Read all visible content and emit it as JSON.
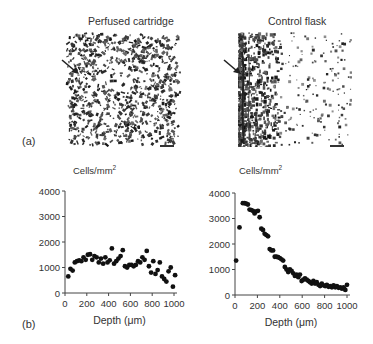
{
  "figure": {
    "panel_a": {
      "label": "(a)",
      "left_title": "Perfused cartridge",
      "right_title": "Control flask",
      "left_image": "microscopy-perfused-cartridge",
      "right_image": "microscopy-control-flask",
      "arrow_icon": "arrow-down-right-icon",
      "scale_bar": "scale-bar"
    },
    "panel_b": {
      "label": "(b)"
    }
  },
  "chart_data": [
    {
      "type": "scatter",
      "title": "Perfused cartridge",
      "ylabel": "Cells/mm²",
      "ylabel_base": "Cells/mm",
      "ylabel_sup": "2",
      "xlabel": "Depth (μm)",
      "xlim": [
        0,
        1000
      ],
      "ylim": [
        0,
        4000
      ],
      "xticks": [
        0,
        200,
        400,
        600,
        800,
        1000
      ],
      "yticks": [
        0,
        1000,
        2000,
        3000,
        4000
      ],
      "xtick_labels": [
        "0",
        "200",
        "400",
        "600",
        "800",
        "1000"
      ],
      "ytick_labels": [
        "0",
        "1000",
        "2000",
        "3000",
        "4000"
      ],
      "grid": false,
      "x": [
        30,
        50,
        70,
        90,
        110,
        130,
        150,
        170,
        190,
        210,
        230,
        250,
        270,
        290,
        310,
        330,
        350,
        370,
        390,
        410,
        430,
        450,
        470,
        490,
        510,
        530,
        550,
        570,
        590,
        610,
        630,
        650,
        670,
        690,
        710,
        730,
        750,
        770,
        790,
        810,
        830,
        850,
        870,
        890,
        910,
        930,
        950,
        970,
        990,
        1010
      ],
      "y": [
        650,
        950,
        880,
        1200,
        1250,
        1280,
        1250,
        1400,
        1300,
        1500,
        1520,
        1300,
        1450,
        1400,
        1200,
        1350,
        1150,
        1400,
        1200,
        1280,
        1750,
        1150,
        1250,
        1350,
        1450,
        1680,
        1050,
        1000,
        1100,
        1100,
        1050,
        1100,
        1250,
        1200,
        1400,
        1300,
        1650,
        1050,
        800,
        1250,
        750,
        900,
        1200,
        650,
        550,
        450,
        850,
        1000,
        250,
        700
      ]
    },
    {
      "type": "scatter",
      "title": "Control flask",
      "ylabel": "Cells/mm²",
      "ylabel_base": "Cells/mm",
      "ylabel_sup": "2",
      "xlabel": "Depth (μm)",
      "xlim": [
        0,
        1000
      ],
      "ylim": [
        0,
        4000
      ],
      "xticks": [
        0,
        200,
        400,
        600,
        800,
        1000
      ],
      "yticks": [
        0,
        1000,
        2000,
        3000,
        4000
      ],
      "xtick_labels": [
        "0",
        "200",
        "400",
        "600",
        "800",
        "1000"
      ],
      "ytick_labels": [
        "0",
        "1000",
        "2000",
        "3000",
        "4000"
      ],
      "grid": false,
      "x": [
        10,
        40,
        70,
        85,
        100,
        115,
        130,
        145,
        160,
        175,
        190,
        205,
        220,
        235,
        250,
        265,
        280,
        295,
        310,
        325,
        340,
        355,
        370,
        385,
        400,
        415,
        430,
        445,
        460,
        475,
        490,
        505,
        520,
        535,
        550,
        565,
        580,
        595,
        610,
        625,
        640,
        655,
        670,
        685,
        700,
        715,
        730,
        745,
        760,
        775,
        790,
        805,
        820,
        835,
        850,
        865,
        880,
        895,
        910,
        925,
        940,
        955,
        970,
        985,
        1000
      ],
      "y": [
        1350,
        2650,
        3600,
        3600,
        3580,
        3550,
        3350,
        3330,
        3300,
        3200,
        3280,
        3300,
        3050,
        2600,
        2550,
        2400,
        2350,
        2300,
        1800,
        1750,
        1750,
        1500,
        1500,
        1480,
        1450,
        1400,
        1350,
        1100,
        1000,
        900,
        1000,
        950,
        850,
        750,
        800,
        700,
        800,
        550,
        600,
        650,
        600,
        550,
        500,
        450,
        550,
        450,
        500,
        400,
        350,
        450,
        380,
        350,
        400,
        320,
        350,
        300,
        380,
        300,
        350,
        280,
        300,
        250,
        300,
        200,
        400
      ]
    }
  ]
}
